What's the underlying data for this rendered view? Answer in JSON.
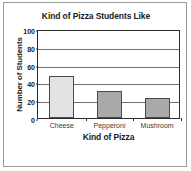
{
  "chart_data": {
    "type": "bar",
    "title": "Kind of Pizza Students Like",
    "xlabel": "Kind of Pizza",
    "ylabel": "Number of Students",
    "categories": [
      "Cheese",
      "Pepperoni",
      "Mushroom"
    ],
    "values": [
      47,
      30,
      22
    ],
    "ylim": [
      0,
      100
    ],
    "yticks": [
      0,
      20,
      40,
      60,
      80,
      100
    ],
    "ytick_labels": [
      "0",
      "20",
      "40",
      "60",
      "80",
      "100"
    ],
    "grid": "horizontal",
    "legend": "none",
    "bar_colors": [
      "#e2e2e2",
      "#a9a9a9",
      "#a9a9a9"
    ],
    "bar_edge_color": "#4a4a4a",
    "axis_color": "#2b2b2b",
    "gridline_color": "#6f6f6f",
    "frame_color": "#9a9a9a",
    "background_color": "#ffffff",
    "text_color": "#1a1a1a"
  }
}
